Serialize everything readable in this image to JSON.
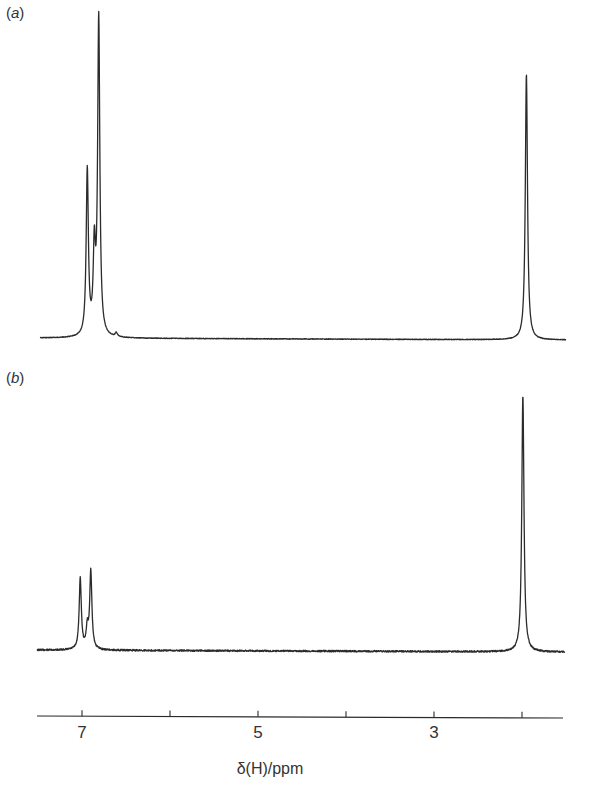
{
  "chart_data": [
    {
      "type": "line",
      "panel": "a",
      "title": "",
      "label": "(a)",
      "xlabel": "δ(H)/ppm",
      "ylabel": "",
      "xlim": [
        7.5,
        1.5
      ],
      "x_reversed": true,
      "grid": false,
      "legend": null,
      "baseline_y_px": 338,
      "peaks": [
        {
          "ppm": 6.94,
          "height": 166
        },
        {
          "ppm": 6.86,
          "height": 82
        },
        {
          "ppm": 6.81,
          "height": 318
        },
        {
          "ppm": 6.61,
          "height": 4
        },
        {
          "ppm": 1.95,
          "height": 266
        }
      ]
    },
    {
      "type": "line",
      "panel": "b",
      "title": "",
      "label": "(b)",
      "xlabel": "δ(H)/ppm",
      "ylabel": "",
      "xlim": [
        7.5,
        1.5
      ],
      "x_reversed": true,
      "grid": false,
      "legend": null,
      "baseline_y_px": 650,
      "peaks": [
        {
          "ppm": 7.02,
          "height": 71
        },
        {
          "ppm": 6.94,
          "height": 20
        },
        {
          "ppm": 6.9,
          "height": 78
        },
        {
          "ppm": 1.99,
          "height": 257
        }
      ]
    }
  ],
  "axis": {
    "ticks": [
      7,
      6,
      5,
      4,
      3,
      2
    ],
    "tick_labels": [
      {
        "value": 7,
        "text": "7"
      },
      {
        "value": 5,
        "text": "5"
      },
      {
        "value": 3,
        "text": "3"
      }
    ],
    "xlabel": "δ(H)/ppm"
  },
  "panels": {
    "a": {
      "label_open": "(",
      "label_letter": "a",
      "label_close": ")"
    },
    "b": {
      "label_open": "(",
      "label_letter": "b",
      "label_close": ")"
    }
  },
  "colors": {
    "trace": "#2b2b2b",
    "background": "#ffffff"
  }
}
